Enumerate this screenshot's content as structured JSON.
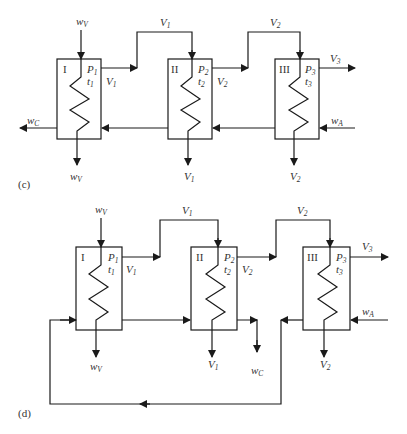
{
  "diagrams": [
    {
      "id": "c",
      "caption": "(c)",
      "effects": [
        {
          "roman": "I",
          "P": "P",
          "P_sub": "1",
          "t": "t",
          "t_sub": "1",
          "vapor_out": "V",
          "vapor_out_sub": "1",
          "bottom": "w",
          "bottom_sub": "V"
        },
        {
          "roman": "II",
          "P": "P",
          "P_sub": "2",
          "t": "t",
          "t_sub": "2",
          "vapor_out": "V",
          "vapor_out_sub": "2",
          "bottom": "V",
          "bottom_sub": "1"
        },
        {
          "roman": "III",
          "P": "P",
          "P_sub": "3",
          "t": "t",
          "t_sub": "3",
          "vapor_out": "V",
          "vapor_out_sub": "3",
          "bottom": "V",
          "bottom_sub": "2"
        }
      ],
      "steam_in": {
        "main": "w",
        "sub": "V"
      },
      "transfer_1": {
        "main": "V",
        "sub": "1"
      },
      "transfer_2": {
        "main": "V",
        "sub": "2"
      },
      "feed": {
        "main": "w",
        "sub": "A"
      },
      "product": {
        "main": "w",
        "sub": "C"
      },
      "flow": "backward feed"
    },
    {
      "id": "d",
      "caption": "(d)",
      "effects": [
        {
          "roman": "I",
          "P": "P",
          "P_sub": "1",
          "t": "t",
          "t_sub": "1",
          "vapor_out": "V",
          "vapor_out_sub": "1",
          "bottom": "w",
          "bottom_sub": "V"
        },
        {
          "roman": "II",
          "P": "P",
          "P_sub": "2",
          "t": "t",
          "t_sub": "2",
          "vapor_out": "V",
          "vapor_out_sub": "2",
          "bottom": "V",
          "bottom_sub": "1"
        },
        {
          "roman": "III",
          "P": "P",
          "P_sub": "3",
          "t": "t",
          "t_sub": "3",
          "vapor_out": "V",
          "vapor_out_sub": "3",
          "bottom": "V",
          "bottom_sub": "2"
        }
      ],
      "steam_in": {
        "main": "w",
        "sub": "V"
      },
      "transfer_1": {
        "main": "V",
        "sub": "1"
      },
      "transfer_2": {
        "main": "V",
        "sub": "2"
      },
      "feed": {
        "main": "w",
        "sub": "A"
      },
      "product": {
        "main": "w",
        "sub": "C"
      },
      "flow": "mixed feed"
    }
  ],
  "colors": {
    "line": "#1a1a1a",
    "text": "#333333"
  }
}
